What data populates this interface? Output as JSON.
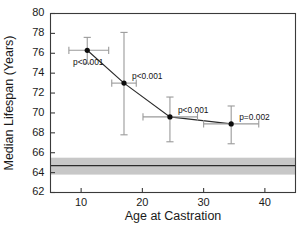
{
  "chart_data": {
    "type": "scatter",
    "title": "",
    "xlabel": "Age at Castration",
    "ylabel": "Median Lifespan (Years)",
    "xlim": [
      5,
      45
    ],
    "ylim": [
      62,
      80
    ],
    "xticks": [
      10,
      20,
      30,
      40
    ],
    "yticks": [
      62,
      64,
      66,
      68,
      70,
      72,
      74,
      76,
      78,
      80
    ],
    "grid": false,
    "legend": "none",
    "x": [
      11.0,
      17.0,
      24.5,
      34.5
    ],
    "y": [
      76.3,
      73.0,
      69.6,
      68.9
    ],
    "xerr_low": [
      8.0,
      15.0,
      20.1,
      30.0
    ],
    "xerr_high": [
      14.5,
      19.0,
      29.0,
      39.0
    ],
    "yerr_low": [
      75.0,
      67.8,
      67.1,
      66.9
    ],
    "yerr_high": [
      77.6,
      78.1,
      71.6,
      70.7
    ],
    "annotations": [
      "p<0.001",
      "p<0.001",
      "p<0.001",
      "p=0.002"
    ],
    "reference_band": {
      "label": "",
      "y_low": 63.8,
      "y_high": 65.5,
      "y_center": 64.7,
      "color": "#c2c2c2",
      "line_color": "#2b2b2b"
    },
    "marker_color": "#0d0d0d",
    "line_color": "#2b2b2b",
    "error_color": "#9a9a9a"
  }
}
